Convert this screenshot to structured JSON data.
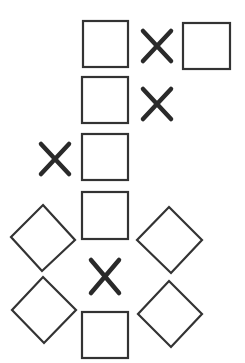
{
  "diagram": {
    "title": "",
    "background": "#ffffff",
    "stroke_color": "#333333",
    "x_color": "#2a2a2a",
    "squares": [
      {
        "id": "square-1",
        "x": 83,
        "y": 21,
        "w": 45,
        "h": 46
      },
      {
        "id": "square-2",
        "x": 183,
        "y": 23,
        "w": 47,
        "h": 46
      },
      {
        "id": "square-3",
        "x": 82,
        "y": 77,
        "w": 46,
        "h": 46
      },
      {
        "id": "square-4",
        "x": 82,
        "y": 134,
        "w": 46,
        "h": 46
      },
      {
        "id": "square-5",
        "x": 82,
        "y": 192,
        "w": 46,
        "h": 47
      },
      {
        "id": "square-6",
        "x": 82,
        "y": 312,
        "w": 46,
        "h": 46
      }
    ],
    "crosses": [
      {
        "id": "x-1",
        "x1": 143,
        "y1": 31,
        "x2": 171,
        "y2": 61
      },
      {
        "id": "x-2",
        "x1": 143,
        "y1": 89,
        "x2": 171,
        "y2": 119
      },
      {
        "id": "x-3",
        "x1": 41,
        "y1": 144,
        "x2": 69,
        "y2": 174
      },
      {
        "id": "x-4",
        "x1": 91,
        "y1": 260,
        "x2": 119,
        "y2": 293
      }
    ],
    "diamonds": [
      {
        "id": "diamond-1",
        "points": "43,205 75,240 42,271 11,237"
      },
      {
        "id": "diamond-2",
        "points": "169,207 202,240 171,273 137,240"
      },
      {
        "id": "diamond-3",
        "points": "43,277 76,310 44,343 12,310"
      },
      {
        "id": "diamond-4",
        "points": "169,281 202,314 171,347 138,314"
      }
    ]
  }
}
